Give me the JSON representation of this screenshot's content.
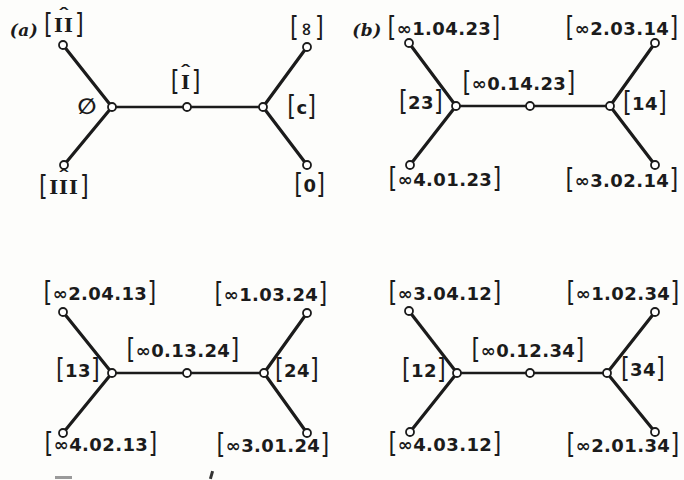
{
  "colors": {
    "ink": "#1b1b1b",
    "paper": "#fdfdfb",
    "node_fill": "#ffffff"
  },
  "syms": {
    "lb": "[",
    "rb": "]",
    "hat": "ˆ"
  },
  "figures": {
    "a": {
      "tag": "(a)",
      "leaf_top_left": "II",
      "leaf_top_right": "∞",
      "node_left": "∅",
      "node_middle": "I",
      "node_right": "c",
      "leaf_bottom_left": "III",
      "leaf_bottom_right": "0"
    },
    "b": {
      "tag": "(b)",
      "leaf_top_left": "∞1.04.23",
      "leaf_top_right": "∞2.03.14",
      "node_left": "23",
      "node_middle": "∞0.14.23",
      "node_right": "14",
      "leaf_bottom_left": "∞4.01.23",
      "leaf_bottom_right": "∞3.02.14"
    },
    "c": {
      "leaf_top_left": "∞2.04.13",
      "leaf_top_right": "∞1.03.24",
      "node_left": "13",
      "node_middle": "∞0.13.24",
      "node_right": "24",
      "leaf_bottom_left": "∞4.02.13",
      "leaf_bottom_right": "∞3.01.24"
    },
    "d": {
      "leaf_top_left": "∞3.04.12",
      "leaf_top_right": "∞1.02.34",
      "node_left": "12",
      "node_middle": "∞0.12.34",
      "node_right": "34",
      "leaf_bottom_left": "∞4.03.12",
      "leaf_bottom_right": "∞2.01.34"
    }
  }
}
